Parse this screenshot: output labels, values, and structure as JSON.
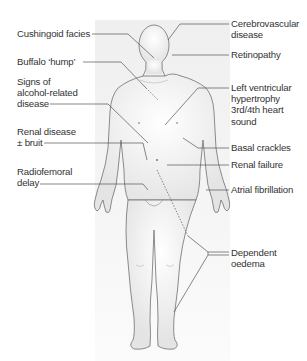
{
  "figure": {
    "left_labels": [
      {
        "id": "cushingoid",
        "lines": [
          "Cushingoid facies"
        ]
      },
      {
        "id": "buffalo",
        "lines": [
          "Buffalo ‘hump’"
        ]
      },
      {
        "id": "alcohol",
        "lines": [
          "Signs of",
          "alcohol-related",
          "disease"
        ]
      },
      {
        "id": "renal-disease",
        "lines": [
          "Renal disease",
          "± bruit"
        ]
      },
      {
        "id": "radiofemoral",
        "lines": [
          "Radiofemoral",
          "delay"
        ]
      }
    ],
    "right_labels": [
      {
        "id": "cerebrovascular",
        "lines": [
          "Cerebrovascular",
          "disease"
        ]
      },
      {
        "id": "retinopathy",
        "lines": [
          "Retinopathy"
        ]
      },
      {
        "id": "lvh",
        "lines": [
          "Left ventricular",
          "hypertrophy",
          "3rd/4th heart",
          "sound"
        ]
      },
      {
        "id": "basal",
        "lines": [
          "Basal crackles"
        ]
      },
      {
        "id": "renal-failure",
        "lines": [
          "Renal failure"
        ]
      },
      {
        "id": "af",
        "lines": [
          "Atrial fibrillation"
        ]
      },
      {
        "id": "oedema",
        "lines": [
          "Dependent",
          "oedema"
        ]
      }
    ],
    "colors": {
      "text": "#333333",
      "leader": "#555555",
      "body_outline": "#666666",
      "panel": "#f0f0f0"
    }
  }
}
